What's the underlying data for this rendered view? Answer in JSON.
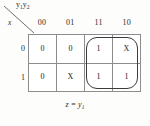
{
  "figure": {
    "type": "karnaugh-map",
    "column_variable_label": "y1y2",
    "column_variable_label_base": "y",
    "row_variable_label": "x",
    "column_headers": [
      "00",
      "01",
      "11",
      "10"
    ],
    "row_headers": [
      "0",
      "1"
    ],
    "rows": [
      {
        "header": "0",
        "cells": [
          "0",
          "0",
          "1",
          "X"
        ]
      },
      {
        "header": "1",
        "cells": [
          "0",
          "X",
          "1",
          "1"
        ]
      }
    ],
    "grouping": {
      "name": "implicant-group",
      "covers_columns": [
        "11",
        "10"
      ],
      "covers_rows": [
        "0",
        "1"
      ],
      "shape": "rounded-rectangle",
      "color": "#3c3c3c"
    },
    "caption": "z = y1",
    "caption_lhs": "z",
    "caption_operator": "=",
    "caption_rhs_base": "y",
    "caption_rhs_sub": "1",
    "colors": {
      "background": "#fdfdfb",
      "grid_line": "#8d8d8d",
      "text": "#2b2b2b",
      "group_outline": "#3c3c3c"
    }
  }
}
